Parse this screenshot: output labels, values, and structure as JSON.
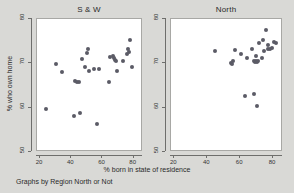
{
  "figure": {
    "caption": "Graphs by Region North or Not",
    "xlabel": "% born in state of residence",
    "ylabel": "% who own home",
    "background_color": "#d9d9d6",
    "panel_background_color": "#ffffff",
    "marker_color": "#5b5b66"
  },
  "chart_data": {
    "type": "scatter",
    "title": "",
    "xlabel": "% born in state of residence",
    "ylabel": "% who own home",
    "caption": "Graphs by Region North or Not",
    "xlim": [
      18,
      86
    ],
    "ylim": [
      50,
      80
    ],
    "xticks": [
      20,
      40,
      60,
      80
    ],
    "yticks": [
      50,
      60,
      70,
      80
    ],
    "grid": false,
    "legend": "none",
    "facets": [
      {
        "name": "S & W",
        "label": "S & W",
        "points": [
          {
            "x": 24.5,
            "y": 59.4
          },
          {
            "x": 30.8,
            "y": 69.7
          },
          {
            "x": 34.5,
            "y": 67.9
          },
          {
            "x": 42.6,
            "y": 58.0
          },
          {
            "x": 43.3,
            "y": 65.9
          },
          {
            "x": 44.5,
            "y": 65.6
          },
          {
            "x": 45.4,
            "y": 65.5
          },
          {
            "x": 46.3,
            "y": 58.6
          },
          {
            "x": 47.5,
            "y": 70.8
          },
          {
            "x": 49.4,
            "y": 68.9
          },
          {
            "x": 50.6,
            "y": 72.2
          },
          {
            "x": 51.3,
            "y": 73.0
          },
          {
            "x": 51.8,
            "y": 68.1
          },
          {
            "x": 55.0,
            "y": 68.6
          },
          {
            "x": 57.4,
            "y": 56.2
          },
          {
            "x": 58.6,
            "y": 68.6
          },
          {
            "x": 64.8,
            "y": 65.6
          },
          {
            "x": 65.5,
            "y": 71.2
          },
          {
            "x": 67.6,
            "y": 71.5
          },
          {
            "x": 68.2,
            "y": 70.9
          },
          {
            "x": 68.6,
            "y": 70.6
          },
          {
            "x": 69.0,
            "y": 70.2
          },
          {
            "x": 70.2,
            "y": 68.0
          },
          {
            "x": 73.8,
            "y": 70.2
          },
          {
            "x": 76.4,
            "y": 71.9
          },
          {
            "x": 76.8,
            "y": 73.0
          },
          {
            "x": 77.4,
            "y": 72.3
          },
          {
            "x": 78.2,
            "y": 75.1
          },
          {
            "x": 79.6,
            "y": 68.9
          }
        ]
      },
      {
        "name": "North",
        "label": "North",
        "points": [
          {
            "x": 45.1,
            "y": 72.5
          },
          {
            "x": 55.2,
            "y": 69.8
          },
          {
            "x": 55.8,
            "y": 69.6
          },
          {
            "x": 56.0,
            "y": 70.3
          },
          {
            "x": 57.3,
            "y": 72.8
          },
          {
            "x": 61.0,
            "y": 71.8
          },
          {
            "x": 63.8,
            "y": 62.3
          },
          {
            "x": 65.0,
            "y": 70.9
          },
          {
            "x": 68.0,
            "y": 73.0
          },
          {
            "x": 69.0,
            "y": 62.9
          },
          {
            "x": 69.2,
            "y": 70.2
          },
          {
            "x": 69.8,
            "y": 70.0
          },
          {
            "x": 70.2,
            "y": 71.4
          },
          {
            "x": 70.4,
            "y": 70.3
          },
          {
            "x": 70.8,
            "y": 60.2
          },
          {
            "x": 71.0,
            "y": 70.1
          },
          {
            "x": 71.6,
            "y": 70.4
          },
          {
            "x": 72.0,
            "y": 74.4
          },
          {
            "x": 73.6,
            "y": 71.0
          },
          {
            "x": 74.2,
            "y": 75.0
          },
          {
            "x": 75.0,
            "y": 72.6
          },
          {
            "x": 76.3,
            "y": 77.3
          },
          {
            "x": 77.2,
            "y": 73.1
          },
          {
            "x": 77.8,
            "y": 73.9
          },
          {
            "x": 79.0,
            "y": 72.9
          },
          {
            "x": 80.2,
            "y": 73.2
          },
          {
            "x": 81.4,
            "y": 74.5
          },
          {
            "x": 82.3,
            "y": 74.4
          }
        ]
      }
    ]
  }
}
